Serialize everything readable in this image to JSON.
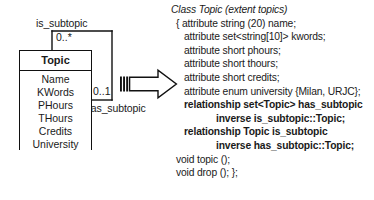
{
  "diagram": {
    "association_top_label": "is_subtopic",
    "association_bottom_label": "has_subtopic",
    "multiplicity_top": "0..*",
    "multiplicity_bottom": "0..1",
    "class_box": {
      "name": "Topic",
      "attributes": [
        "Name",
        "KWords",
        "PHours",
        "THours",
        "Credits",
        "University"
      ]
    },
    "arrow": {
      "name": "maps-to-arrow"
    },
    "colors": {
      "stroke": "#111111",
      "background": "#ffffff",
      "text": "#1a1a1a"
    }
  },
  "odl": {
    "lines": [
      {
        "text": "Class Topic (extent topics)",
        "style": "italic",
        "indent": 0
      },
      {
        "text": "{ attribute string (20) name;",
        "style": "regular",
        "indent": 1
      },
      {
        "text": "attribute set<string[10]> kwords;",
        "style": "regular",
        "indent": 2
      },
      {
        "text": "attribute short phours;",
        "style": "regular",
        "indent": 2
      },
      {
        "text": "attribute short thours;",
        "style": "regular",
        "indent": 2
      },
      {
        "text": "attribute short credits;",
        "style": "regular",
        "indent": 2
      },
      {
        "text": "attribute enum university {Milan, URJC};",
        "style": "regular",
        "indent": 2
      },
      {
        "text": "relationship set<Topic> has_subtopic",
        "style": "bold",
        "indent": 2
      },
      {
        "text": "inverse is_subtopic::Topic;",
        "style": "bold",
        "indent": 3
      },
      {
        "text": "relationship Topic is_subtopic",
        "style": "bold",
        "indent": 2
      },
      {
        "text": "inverse has_subtopic::Topic;",
        "style": "bold",
        "indent": 3
      },
      {
        "text": "void topic ();",
        "style": "regular",
        "indent": 1
      },
      {
        "text": "void drop (); };",
        "style": "regular",
        "indent": 1
      }
    ]
  }
}
